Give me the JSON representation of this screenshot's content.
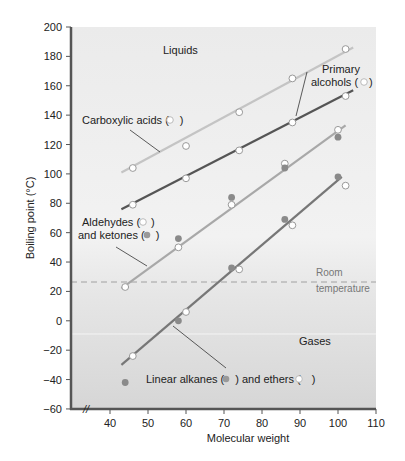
{
  "chart_data": {
    "type": "scatter",
    "title": "",
    "xlabel": "Molecular weight",
    "ylabel": "Boiling point (°C)",
    "xlim": [
      30,
      110
    ],
    "ylim": [
      -60,
      200
    ],
    "x_ticks": [
      40,
      50,
      60,
      70,
      80,
      90,
      100,
      110
    ],
    "y_ticks": [
      -60,
      -40,
      -20,
      0,
      20,
      40,
      60,
      80,
      100,
      120,
      140,
      160,
      180,
      200
    ],
    "axis_break": "//",
    "regions": [
      {
        "label": "Liquids",
        "position": "top"
      },
      {
        "label": "Gases",
        "position": "bottom"
      }
    ],
    "reference_line": {
      "label_line1": "Room",
      "label_line2": "temperature",
      "y": 25,
      "style": "dashed"
    },
    "series": [
      {
        "name": "Carboxylic acids",
        "marker": "open",
        "line_color": "#c4c4c4",
        "label": "Carboxylic acids (",
        "label_suffix": ")",
        "fit": [
          [
            43,
            101
          ],
          [
            104,
            186
          ]
        ],
        "points": [
          [
            46,
            104
          ],
          [
            60,
            119
          ],
          [
            74,
            142
          ],
          [
            88,
            165
          ],
          [
            102,
            185
          ]
        ]
      },
      {
        "name": "Primary alcohols",
        "marker": "open",
        "line_color": "#555555",
        "label_line1": "Primary",
        "label_line2": "alcohols (",
        "label_suffix": ")",
        "fit": [
          [
            43,
            76
          ],
          [
            104,
            157
          ]
        ],
        "points": [
          [
            46,
            79
          ],
          [
            60,
            97
          ],
          [
            74,
            116
          ],
          [
            88,
            135
          ],
          [
            102,
            153
          ]
        ]
      },
      {
        "name": "Aldehydes",
        "marker": "open",
        "line_color": "#a8a8a8",
        "label_line1": "Aldehydes (",
        "fit": [
          [
            43,
            22
          ],
          [
            102,
            133
          ]
        ],
        "points": [
          [
            44,
            23
          ],
          [
            58,
            50
          ],
          [
            72,
            79
          ],
          [
            86,
            107
          ],
          [
            100,
            130
          ]
        ]
      },
      {
        "name": "Ketones",
        "marker": "filled",
        "label_line2": "and ketones (",
        "points": [
          [
            58,
            56
          ],
          [
            72,
            84
          ],
          [
            86,
            104
          ],
          [
            100,
            125
          ]
        ]
      },
      {
        "name": "Linear alkanes",
        "marker": "filled",
        "line_color": "#777777",
        "label": "Linear alkanes (",
        "fit": [
          [
            43,
            -30
          ],
          [
            101,
            98
          ]
        ],
        "points": [
          [
            44,
            -42
          ],
          [
            58,
            0
          ],
          [
            72,
            36
          ],
          [
            86,
            69
          ],
          [
            100,
            98
          ]
        ]
      },
      {
        "name": "Ethers",
        "marker": "open",
        "label": ") and ethers (",
        "label_suffix": ")",
        "points": [
          [
            46,
            -24
          ],
          [
            60,
            6
          ],
          [
            74,
            35
          ],
          [
            88,
            65
          ],
          [
            102,
            92
          ]
        ]
      }
    ]
  },
  "labels": {
    "liquids": "Liquids",
    "gases": "Gases",
    "room1": "Room",
    "room2": "temperature",
    "carboxylic": "Carboxylic acids (",
    "paren_close": ")",
    "primary1": "Primary",
    "primary2": "alcohols (",
    "aldehydes": "Aldehydes (",
    "ketones": "and ketones (",
    "alkanes": "Linear alkanes (",
    "ethers": ") and ethers (",
    "xlabel": "Molecular weight",
    "ylabel": "Boiling point (°C)",
    "break": "//"
  },
  "colors": {
    "bg_top": "#e6e6e6",
    "bg_bottom": "#d8d8d8",
    "axis": "#555555",
    "filled_marker": "#8a8a8a",
    "dashed": "#999999"
  }
}
